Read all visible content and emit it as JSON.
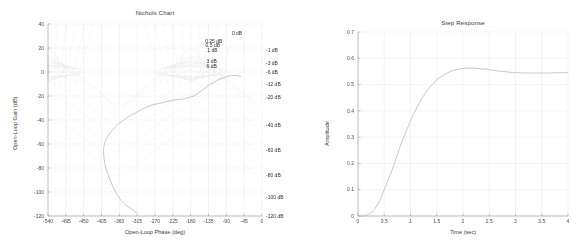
{
  "figure": {
    "width": 583,
    "height": 252,
    "background": "#ffffff",
    "panels": 2
  },
  "colors": {
    "axis": "#9a9a9a",
    "grid": "#e2e2e2",
    "nichols_grid": "#d9d9d9",
    "curve": "#b9c4cc",
    "text": "#3c3c3c"
  },
  "chart_data": [
    {
      "type": "line",
      "name": "nichols-chart",
      "title": "Nichols Chart",
      "xlabel": "Open-Loop Phase (deg)",
      "ylabel": "Open-Loop Gain (dB)",
      "xlim": [
        -540,
        0
      ],
      "ylim": [
        -120,
        40
      ],
      "xticks": [
        -540,
        -495,
        -450,
        -405,
        -360,
        -315,
        -270,
        -225,
        -180,
        -135,
        -90,
        -45,
        0
      ],
      "xticklabels": [
        "-540",
        "-495",
        "-450",
        "-405",
        "-360",
        "-315",
        "-270",
        "-225",
        "-180",
        "-135",
        "-90",
        "-45",
        "0"
      ],
      "yticks": [
        40,
        20,
        0,
        -20,
        -40,
        -60,
        -80,
        -100,
        -120
      ],
      "yticklabels": [
        "40",
        "20",
        "0",
        "-20",
        "-40",
        "-60",
        "-80",
        "-100",
        "-120"
      ],
      "grid": true,
      "legend": "none",
      "nichols_grid_labels_upper": [
        {
          "text": "0 dB",
          "phase": -60,
          "gain": 32
        },
        {
          "text": "0.25 dB",
          "phase": -110,
          "gain": 26
        },
        {
          "text": "0.5 dB",
          "phase": -116,
          "gain": 22
        },
        {
          "text": "1 dB",
          "phase": -122,
          "gain": 18
        },
        {
          "text": "3 dB",
          "phase": -124,
          "gain": 9
        },
        {
          "text": "6 dB",
          "phase": -124,
          "gain": 5
        }
      ],
      "nichols_grid_labels_right": [
        {
          "text": "-1 dB",
          "gain": 18
        },
        {
          "text": "-3 dB",
          "gain": 7
        },
        {
          "text": "-6 dB",
          "gain": 0
        },
        {
          "text": "-12 dB",
          "gain": -10
        },
        {
          "text": "-20 dB",
          "gain": -21
        },
        {
          "text": "-40 dB",
          "gain": -44
        },
        {
          "text": "-60 dB",
          "gain": -65
        },
        {
          "text": "-80 dB",
          "gain": -86
        },
        {
          "text": "-100 dB",
          "gain": -104
        },
        {
          "text": "-120 dB",
          "gain": -120
        }
      ],
      "series": [
        {
          "name": "open-loop-response",
          "points": [
            [
              -316,
              -117
            ],
            [
              -330,
              -114
            ],
            [
              -344,
              -111
            ],
            [
              -356,
              -107
            ],
            [
              -366,
              -102
            ],
            [
              -374,
              -97
            ],
            [
              -381,
              -92
            ],
            [
              -388,
              -86
            ],
            [
              -393,
              -81
            ],
            [
              -397,
              -76
            ],
            [
              -399,
              -71
            ],
            [
              -400,
              -66
            ],
            [
              -399,
              -62
            ],
            [
              -396,
              -58
            ],
            [
              -392,
              -55
            ],
            [
              -386,
              -52
            ],
            [
              -379,
              -49
            ],
            [
              -371,
              -46
            ],
            [
              -362,
              -43
            ],
            [
              -352,
              -41
            ],
            [
              -341,
              -38
            ],
            [
              -330,
              -36
            ],
            [
              -319,
              -34
            ],
            [
              -308,
              -32
            ],
            [
              -296,
              -30
            ],
            [
              -283,
              -28
            ],
            [
              -270,
              -27
            ],
            [
              -257,
              -26
            ],
            [
              -244,
              -25
            ],
            [
              -231,
              -24
            ],
            [
              -218,
              -23
            ],
            [
              -205,
              -23
            ],
            [
              -193,
              -22
            ],
            [
              -182,
              -21
            ],
            [
              -172,
              -20
            ],
            [
              -163,
              -18
            ],
            [
              -154,
              -16
            ],
            [
              -146,
              -14
            ],
            [
              -138,
              -12
            ],
            [
              -130,
              -10
            ],
            [
              -122,
              -9
            ],
            [
              -114,
              -7
            ],
            [
              -106,
              -6
            ],
            [
              -98,
              -5
            ],
            [
              -89,
              -4
            ],
            [
              -80,
              -3
            ],
            [
              -71,
              -3
            ],
            [
              -62,
              -3
            ],
            [
              -53,
              -4
            ]
          ]
        }
      ]
    },
    {
      "type": "line",
      "name": "step-response",
      "title": "Step Response",
      "xlabel": "Time (sec)",
      "ylabel": "Amplitude",
      "xlim": [
        0,
        4
      ],
      "ylim": [
        0,
        0.7
      ],
      "xticks": [
        0,
        0.5,
        1,
        1.5,
        2,
        2.5,
        3,
        3.5,
        4
      ],
      "xticklabels": [
        "0",
        "0.5",
        "1",
        "1.5",
        "2",
        "2.5",
        "3",
        "3.5",
        "4"
      ],
      "yticks": [
        0,
        0.1,
        0.2,
        0.3,
        0.4,
        0.5,
        0.6,
        0.7
      ],
      "yticklabels": [
        "0",
        "0.1",
        "0.2",
        "0.3",
        "0.4",
        "0.5",
        "0.6",
        "0.7"
      ],
      "grid": true,
      "legend": "none",
      "steady_state": 0.545,
      "peak_value": 0.563,
      "peak_time": 2.15,
      "series": [
        {
          "name": "closed-loop-step",
          "points": [
            [
              0.0,
              0.0
            ],
            [
              0.08,
              0.0
            ],
            [
              0.15,
              0.002
            ],
            [
              0.22,
              0.008
            ],
            [
              0.3,
              0.022
            ],
            [
              0.38,
              0.045
            ],
            [
              0.45,
              0.075
            ],
            [
              0.52,
              0.11
            ],
            [
              0.6,
              0.15
            ],
            [
              0.68,
              0.192
            ],
            [
              0.75,
              0.234
            ],
            [
              0.82,
              0.274
            ],
            [
              0.9,
              0.314
            ],
            [
              0.98,
              0.352
            ],
            [
              1.05,
              0.385
            ],
            [
              1.13,
              0.415
            ],
            [
              1.2,
              0.442
            ],
            [
              1.28,
              0.466
            ],
            [
              1.35,
              0.486
            ],
            [
              1.43,
              0.503
            ],
            [
              1.5,
              0.518
            ],
            [
              1.58,
              0.53
            ],
            [
              1.65,
              0.539
            ],
            [
              1.73,
              0.547
            ],
            [
              1.8,
              0.553
            ],
            [
              1.88,
              0.557
            ],
            [
              1.95,
              0.56
            ],
            [
              2.05,
              0.562
            ],
            [
              2.15,
              0.563
            ],
            [
              2.25,
              0.562
            ],
            [
              2.35,
              0.56
            ],
            [
              2.45,
              0.558
            ],
            [
              2.55,
              0.555
            ],
            [
              2.65,
              0.552
            ],
            [
              2.75,
              0.55
            ],
            [
              2.85,
              0.548
            ],
            [
              2.95,
              0.546
            ],
            [
              3.05,
              0.545
            ],
            [
              3.2,
              0.544
            ],
            [
              3.4,
              0.544
            ],
            [
              3.6,
              0.544
            ],
            [
              3.8,
              0.545
            ],
            [
              4.0,
              0.545
            ]
          ]
        }
      ]
    }
  ]
}
